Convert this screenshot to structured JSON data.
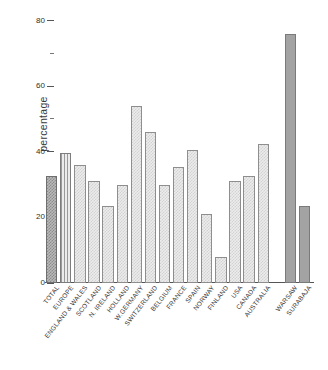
{
  "chart_data": {
    "type": "bar",
    "title": "",
    "subtitle": "",
    "xlabel": "",
    "ylabel": "percentage",
    "ylim": [
      0,
      82
    ],
    "grid": false,
    "legend": null,
    "y_ticks_major": [
      "20",
      "40",
      "60",
      "80"
    ],
    "y_tick_values_major": [
      20,
      40,
      60,
      80
    ],
    "y_tick_values_minor": [
      10,
      30,
      50,
      70
    ],
    "y_origin_label": "0",
    "categories": [
      "TOTAL",
      "EUROPE",
      "ENGLAND & WALES",
      "SCOTLAND",
      "N. IRELAND",
      "HOLLAND",
      "W.GERMANY",
      "SWITZERLAND",
      "BELGIUM",
      "FRANCE",
      "SPAIN",
      "NORWAY",
      "FINLAND",
      "USA",
      "CANADA",
      "AUSTRALIA",
      "WARSAW",
      "SURABAJA"
    ],
    "values": [
      32.5,
      39.5,
      36.0,
      31.0,
      23.5,
      30.0,
      54.0,
      46.0,
      30.0,
      35.5,
      40.5,
      21.0,
      8.0,
      31.0,
      32.5,
      42.5,
      76.0,
      23.5
    ],
    "bar_styles": [
      "fill-dark",
      "fill-stripe",
      "fill-light",
      "fill-light",
      "fill-light",
      "fill-light",
      "fill-light",
      "fill-light",
      "fill-light",
      "fill-light",
      "fill-light",
      "fill-light",
      "fill-light",
      "fill-light",
      "fill-light",
      "fill-light",
      "fill-solid",
      "fill-solid"
    ],
    "group_break_after_index": 15
  }
}
